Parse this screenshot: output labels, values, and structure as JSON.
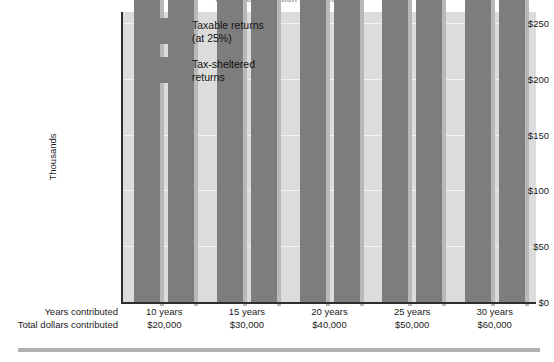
{
  "caption": "annual contribution is $2,000.",
  "chart_data": {
    "type": "bar",
    "title": "",
    "xlabel": "",
    "ylabel": "Thousands",
    "ylim": [
      0,
      260
    ],
    "yticks": [
      0,
      50,
      100,
      150,
      200,
      250
    ],
    "ytick_labels": [
      "$0",
      "$50",
      "$100",
      "$150",
      "$200",
      "$250"
    ],
    "grid": true,
    "legend_position": "upper-left-inside",
    "categories": [
      "10 years",
      "15 years",
      "20 years",
      "25 years",
      "30 years"
    ],
    "series": [
      {
        "name": "Taxable returns\n(at 25%)",
        "color": "#7d7d7d",
        "values": [
          27943,
          49345,
          77985,
          116313,
          167603
        ],
        "value_labels": [
          "$27,943",
          "$49,345",
          "$77,985",
          "$116,313",
          "$167,603"
        ]
      },
      {
        "name": "Tax-sheltered\nreturns",
        "color": "#7d7d7d",
        "values": [
          31920,
          58648,
          98846,
          157909,
          244691
        ],
        "value_labels": [
          "$31,920",
          "$58,648",
          "$98,846",
          "$157,909",
          "$244,691"
        ]
      }
    ],
    "axis_rows": [
      {
        "label": "Years contributed",
        "values": [
          "10 years",
          "15 years",
          "20 years",
          "25 years",
          "30 years"
        ]
      },
      {
        "label": "Total dollars contributed",
        "values": [
          "$20,000",
          "$30,000",
          "$40,000",
          "$50,000",
          "$60,000"
        ]
      }
    ]
  },
  "colors": {
    "bar": "#7d7d7d",
    "bar_shadow": "#b9b9b9",
    "plot_background": "#dcdcdc",
    "gridline": "#f2f2f2",
    "axis": "#2e2e2e",
    "rule": "#b0b0b0"
  }
}
